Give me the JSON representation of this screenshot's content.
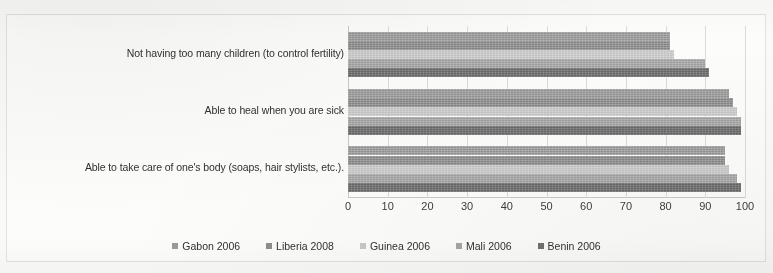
{
  "chart_data": {
    "type": "bar",
    "orientation": "horizontal",
    "title": "",
    "xlabel": "",
    "ylabel": "",
    "xlim": [
      0,
      100
    ],
    "xticks": [
      0,
      10,
      20,
      30,
      40,
      50,
      60,
      70,
      80,
      90,
      100
    ],
    "grid": true,
    "legend_position": "bottom",
    "categories": [
      "Not having too many children (to control fertility)",
      "Able to heal when you are sick",
      "Able to take care of one's body (soaps, hair stylists, etc.)."
    ],
    "series": [
      {
        "name": "Gabon 2006",
        "color": "#9a9a9a",
        "values": [
          81,
          96,
          95
        ]
      },
      {
        "name": "Liberia 2008",
        "color": "#8d8d8d",
        "values": [
          81,
          97,
          95
        ]
      },
      {
        "name": "Guinea 2006",
        "color": "#c8c8c8",
        "values": [
          82,
          98,
          96
        ]
      },
      {
        "name": "Mali 2006",
        "color": "#a5a5a5",
        "values": [
          90,
          99,
          98
        ]
      },
      {
        "name": "Benin 2006",
        "color": "#6e6e6e",
        "values": [
          91,
          99,
          99
        ]
      }
    ]
  },
  "legend": {
    "items": [
      {
        "label": "Gabon 2006",
        "swatch": "#9a9a9a"
      },
      {
        "label": "Liberia 2008",
        "swatch": "#8d8d8d"
      },
      {
        "label": "Guinea 2006",
        "swatch": "#c8c8c8"
      },
      {
        "label": "Mali 2006",
        "swatch": "#a5a5a5"
      },
      {
        "label": "Benin 2006",
        "swatch": "#6e6e6e"
      }
    ]
  }
}
